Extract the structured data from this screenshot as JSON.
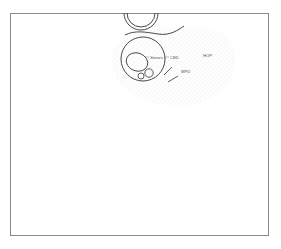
{
  "diagram": {
    "labels": {
      "stones": "Stones",
      "cbd": "CBD",
      "hop": "HOP",
      "mpd": "MPD"
    },
    "colors": {
      "frame": "#8a8a8a",
      "stroke": "#333333",
      "stipple": "#cfcfcf",
      "label": "#555555"
    }
  }
}
